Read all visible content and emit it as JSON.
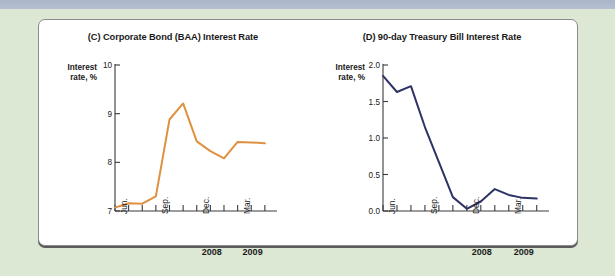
{
  "figure": {
    "background_color": "#dde8d4",
    "panel_color": "#ffffff",
    "topbar_color": "#aab6c9"
  },
  "chart_data": [
    {
      "id": "C",
      "type": "line",
      "title": "(C) Corporate Bond (BAA) Interest Rate",
      "ylabel_line1": "Interest",
      "ylabel_line2": "rate, %",
      "xlabel": "",
      "ylim": [
        7,
        10
      ],
      "yticks": [
        7,
        8,
        9,
        10
      ],
      "ytick_labels": [
        "7",
        "8",
        "9",
        "10"
      ],
      "grid": false,
      "legend": "none",
      "line_color": "#e0913f",
      "categories": [
        "Jun.",
        "Jul.",
        "Aug.",
        "Sep.",
        "Oct.",
        "Nov.",
        "Dec.",
        "Jan.",
        "Feb.",
        "Mar.",
        "Apr.",
        "May"
      ],
      "xtick_labels": [
        "Jun.",
        "Sep.",
        "Dec.",
        "Mar."
      ],
      "xtick_label_indices": [
        0,
        3,
        6,
        9
      ],
      "year_labels": [
        "2008",
        "2009"
      ],
      "year_label_indices": [
        6,
        9
      ],
      "values": [
        7.07,
        7.16,
        7.15,
        7.3,
        8.88,
        9.21,
        8.43,
        8.23,
        8.08,
        8.42,
        8.41,
        8.39
      ],
      "x": [
        0,
        1,
        2,
        3,
        4,
        5,
        6,
        7,
        8,
        9,
        10,
        11
      ]
    },
    {
      "id": "D",
      "type": "line",
      "title": "(D) 90-day Treasury Bill Interest Rate",
      "ylabel_line1": "Interest",
      "ylabel_line2": "rate, %",
      "xlabel": "",
      "ylim": [
        0.0,
        2.0
      ],
      "yticks": [
        0.0,
        0.5,
        1.0,
        1.5,
        2.0
      ],
      "ytick_labels": [
        "0.0",
        "0.5",
        "1.0",
        "1.5",
        "2.0"
      ],
      "grid": false,
      "legend": "none",
      "line_color": "#2e3366",
      "categories": [
        "Jun.",
        "Jul.",
        "Aug.",
        "Sep.",
        "Oct.",
        "Nov.",
        "Dec.",
        "Jan.",
        "Feb.",
        "Mar.",
        "Apr.",
        "May"
      ],
      "xtick_labels": [
        "Jun.",
        "Sep.",
        "Dec.",
        "Mar."
      ],
      "xtick_label_indices": [
        0,
        3,
        6,
        9
      ],
      "year_labels": [
        "2008",
        "2009"
      ],
      "year_label_indices": [
        6,
        9
      ],
      "values": [
        1.85,
        1.63,
        1.71,
        1.15,
        0.67,
        0.19,
        0.03,
        0.13,
        0.3,
        0.22,
        0.18,
        0.17
      ],
      "x": [
        0,
        1,
        2,
        3,
        4,
        5,
        6,
        7,
        8,
        9,
        10,
        11
      ]
    }
  ]
}
